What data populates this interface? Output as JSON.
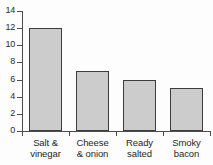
{
  "chart_data": {
    "type": "bar",
    "title": "",
    "subtitle": "",
    "xlabel": "",
    "ylabel": "",
    "categories": [
      "Salt & vinegar",
      "Cheese & onion",
      "Ready salted",
      "Smoky bacon"
    ],
    "category_lines": [
      [
        "Salt &",
        "vinegar"
      ],
      [
        "Cheese",
        "& onion"
      ],
      [
        "Ready",
        "salted"
      ],
      [
        "Smoky",
        "bacon"
      ]
    ],
    "values": [
      12,
      7,
      6,
      5
    ],
    "ylim": [
      0,
      14
    ],
    "ytick_values": [
      0,
      2,
      4,
      6,
      8,
      10,
      12,
      14
    ],
    "ytick_labels": [
      "0",
      "2",
      "4",
      "6",
      "8",
      "10",
      "12",
      "14"
    ],
    "grid": false,
    "legend": false,
    "legend_position": "none",
    "bar_fill_color": "#cccccc",
    "bar_border_color": "#3d3d3d",
    "axis_color": "#4d4d4d",
    "background_color": "#fdfdfd"
  }
}
